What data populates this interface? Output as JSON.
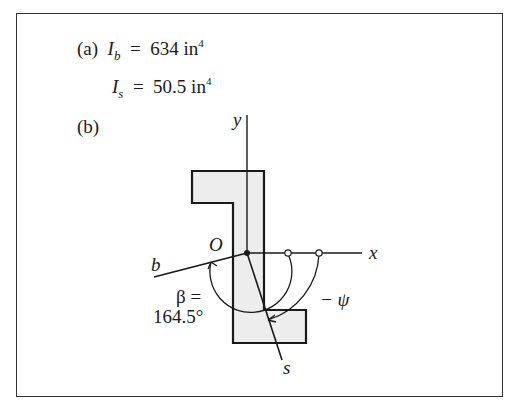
{
  "part_a": {
    "label": "(a)",
    "Ib": {
      "symbol": "I",
      "subscript": "b",
      "equals": "=",
      "value": "634",
      "unit": "in",
      "exponent": "4"
    },
    "Is": {
      "symbol": "I",
      "subscript": "s",
      "equals": "=",
      "value": "50.5",
      "unit": "in",
      "exponent": "4"
    }
  },
  "part_b": {
    "label": "(b)",
    "axes": {
      "y": "y",
      "x": "x",
      "origin": "O",
      "b_axis": "b",
      "s_axis": "s"
    },
    "beta": {
      "line1": "β =",
      "line2": "164.5°"
    },
    "psi": "− ψ"
  },
  "colors": {
    "line": "#1a1a1a",
    "fill": "#ededed",
    "border": "#333333"
  }
}
